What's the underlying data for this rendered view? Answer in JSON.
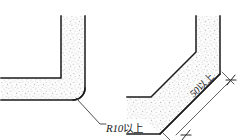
{
  "page": {
    "background_color": "#ffffff",
    "width": 252,
    "height": 140
  },
  "style": {
    "line_color": "#1b1b1b",
    "stipple_color": "#9a9a9a",
    "fill_color": "#fbfbfb",
    "leader_color": "#3a3a3a",
    "text_color": "#1b1b1b"
  },
  "figures": [
    {
      "id": "left-figure",
      "name": "rounded-fillet-corner",
      "description": "L-shaped band meeting at a right angle with a rounded inner fillet",
      "annotation": {
        "id": "r10-callout",
        "value": "R10",
        "unit": "以上",
        "full_text": "R10以上",
        "leader_type": "elbow-leader"
      }
    },
    {
      "id": "right-figure",
      "name": "chamfered-corner",
      "description": "Band bent at an obtuse angle forming a 45 degree chamfer across the corner",
      "annotation": {
        "id": "dim-50-callout",
        "value": "50",
        "unit": "以上",
        "full_text": "50以上",
        "leader_type": "dimension-line-with-slash-ticks"
      }
    }
  ],
  "labels": {
    "r10": {
      "value": "R10",
      "unit": "以上"
    },
    "fifty": {
      "value": "50",
      "unit": "以上"
    }
  }
}
